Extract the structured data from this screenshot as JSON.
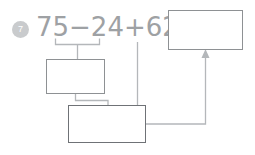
{
  "problem": {
    "number": "7",
    "expression": "75−24+62=",
    "operands": [
      "75",
      "24",
      "62"
    ],
    "operators": [
      "−",
      "+"
    ],
    "equals_sign": "="
  },
  "boxes": {
    "answer_box": {
      "label": "answer-box",
      "value": ""
    },
    "middle_box": {
      "label": "partial-result-box",
      "value": ""
    },
    "bottom_box": {
      "label": "intermediate-sum-box",
      "value": ""
    }
  },
  "annotations": {
    "bracket_label": "grouping-bracket-75-minus-24",
    "arrow_label": "arrow-to-answer-box"
  },
  "colors": {
    "badge_fill": "#c9cbcd",
    "badge_text": "#ffffff",
    "expression_text": "#9ea1a4",
    "box_border": "#8e9194",
    "bottom_box_border": "#6f7276",
    "connector_line": "#b4b7ba",
    "bracket_line": "#b4b7ba",
    "page_background": "#ffffff"
  }
}
